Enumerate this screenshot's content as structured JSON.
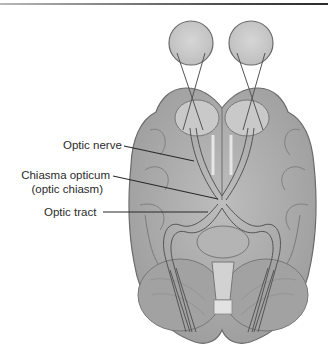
{
  "figure": {
    "type": "anatomical-diagram",
    "colors": {
      "tissue": "#a9a9a9",
      "tissue_light": "#cfcfcf",
      "eye": "#c8c8c8",
      "outline": "#6a6a6a",
      "leader": "#2a2a2a",
      "text": "#2b2b2b"
    }
  },
  "labels": {
    "optic_nerve": "Optic nerve",
    "chiasma_line1": "Chiasma opticum",
    "chiasma_line2": "(optic chiasm)",
    "optic_tract": "Optic tract"
  }
}
